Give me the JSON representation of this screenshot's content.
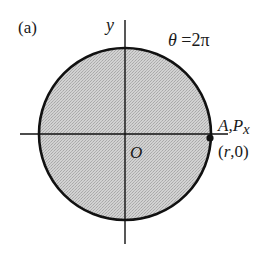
{
  "diagram": {
    "panel_label": "(a)",
    "axis_y_label": "y",
    "origin_label": "O",
    "angle_label": "θ =2π",
    "point_label_A": "A,",
    "point_label_P": "P",
    "point_label_sub": "x",
    "point_coords": "(r,0)",
    "colors": {
      "fill": "#c8c8c8",
      "stroke": "#111111",
      "background": "#ffffff"
    },
    "geometry": {
      "center": [
        125,
        134
      ],
      "radius": 86,
      "point": [
        210,
        137
      ]
    }
  }
}
